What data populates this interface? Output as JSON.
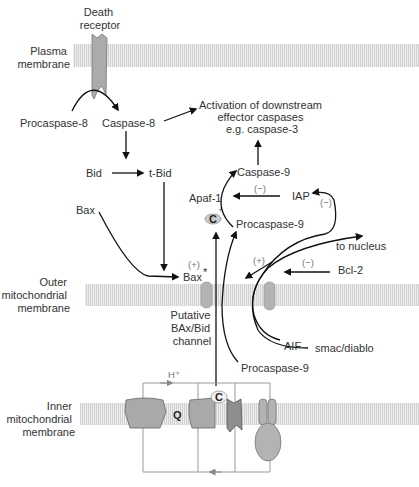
{
  "diagram": {
    "type": "apoptosis-pathway",
    "colors": {
      "membrane_fill": "#e8e8e8",
      "membrane_stripe": "#cfcfcf",
      "protein_fill": "#a9a9a9",
      "protein_dark": "#8e8e8e",
      "arrow": "#111111",
      "text": "#333333",
      "sign_text": "#777777",
      "electron_line": "#999999"
    },
    "membranes": {
      "plasma": [
        "Plasma",
        "membrane"
      ],
      "outer": [
        "Outer",
        "mitochondrial",
        "membrane"
      ],
      "inner": [
        "Inner",
        "mitochondrial",
        "membrane"
      ]
    },
    "labels": {
      "death_receptor": [
        "Death",
        "receptor"
      ],
      "procaspase8": "Procaspase-8",
      "caspase8": "Caspase-8",
      "activation": [
        "Activation of downstream",
        "effector caspases",
        "e.g. caspase-3"
      ],
      "bid": "Bid",
      "tbid": "t-Bid",
      "bax": "Bax",
      "bax_star": "Bax",
      "star": "*",
      "caspase9": "Caspase-9",
      "apaf1": "Apaf-1",
      "plus": "+",
      "cyt_c": "C",
      "procaspase9_top": "Procaspase-9",
      "iap": "IAP",
      "to_nucleus": "to nucleus",
      "bcl2": "Bcl-2",
      "channel": [
        "Putative",
        "BAx/Bid",
        "channel"
      ],
      "aif": "AIF",
      "smac": "smac/diablo",
      "procaspase9_bottom": "Procaspase-9",
      "h_plus": "H⁺",
      "q": "Q",
      "c_inner": "C"
    },
    "signs": {
      "bax_plus": "(+)",
      "iap_apaf_minus": "(−)",
      "iap_loop_minus": "(−)",
      "release_plus": "(+)",
      "bcl2_minus": "(−)"
    }
  }
}
